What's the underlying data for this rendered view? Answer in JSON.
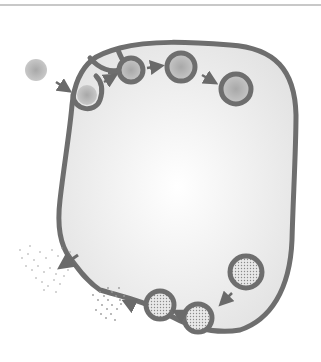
{
  "diagram": {
    "colors": {
      "membrane": "#6e6e6e",
      "cytoplasm_center": "#ffffff",
      "cytoplasm_edge": "#e4e4e4",
      "particle": "#b8b8b8",
      "arrow": "#6a6a6a",
      "divider": "#c8c8c8"
    },
    "endocytosis_steps": [
      {
        "stage": "external-particle",
        "cx": 36,
        "cy": 70,
        "r": 11
      },
      {
        "stage": "invagination",
        "cx": 87,
        "cy": 95,
        "r": 10
      },
      {
        "stage": "pinching",
        "cx": 131,
        "cy": 70,
        "r": 10
      },
      {
        "stage": "vesicle-budded",
        "cx": 182,
        "cy": 67,
        "r": 11
      },
      {
        "stage": "internal-vesicle",
        "cx": 237,
        "cy": 88,
        "r": 13
      }
    ],
    "exocytosis_steps": [
      {
        "stage": "secretory-vesicle",
        "cx": 246,
        "cy": 272,
        "r": 15
      },
      {
        "stage": "docking",
        "cx": 198,
        "cy": 316,
        "r": 14
      },
      {
        "stage": "fusing",
        "cx": 160,
        "cy": 303,
        "r": 14
      },
      {
        "stage": "releasing",
        "cx": 112,
        "cy": 298,
        "r": 0
      },
      {
        "stage": "dispersed-content",
        "cx": 50,
        "cy": 265,
        "r": 0
      }
    ]
  }
}
